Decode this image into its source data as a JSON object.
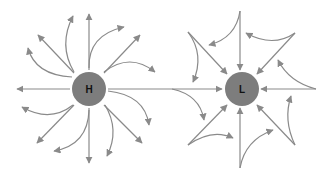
{
  "diagram": {
    "title": "",
    "colors": {
      "arrow": "#8a8a8a",
      "center": "#7d7d7d",
      "label": "#111111",
      "background": "#ffffff"
    },
    "high": {
      "label": "H",
      "center": [
        89,
        89
      ],
      "radius": 17,
      "flow": "outward, clockwise"
    },
    "low": {
      "label": "L",
      "center": [
        242,
        89
      ],
      "radius": 17,
      "flow": "inward, counterclockwise"
    },
    "connector": {
      "from": "H",
      "to": "L"
    }
  }
}
